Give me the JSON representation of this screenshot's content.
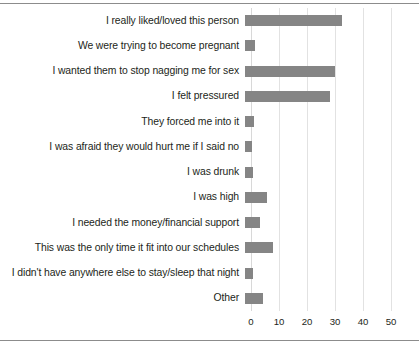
{
  "chart_data": {
    "type": "bar",
    "orientation": "horizontal",
    "title": "",
    "subtitle": "",
    "xlabel": "",
    "ylabel": "",
    "xlim": [
      0,
      50
    ],
    "xticks": [
      "0",
      "10",
      "20",
      "30",
      "40",
      "50"
    ],
    "xtick_values": [
      0,
      10,
      20,
      30,
      40,
      50
    ],
    "grid": true,
    "legend": false,
    "bar_color": "#858585",
    "gridline_color": "#e2e2e2",
    "categories": [
      "I really liked/loved this person",
      "We were trying to become pregnant",
      "I wanted them to stop nagging me for sex",
      "I felt pressured",
      "They forced me into it",
      "I was afraid they would hurt me if I said no",
      "I was drunk",
      "I was high",
      "I needed the money/financial support",
      "This was the only time it fit into our schedules",
      "I didn't have anywhere else to stay/sleep that night",
      "Other"
    ],
    "values": [
      34.5,
      3.6,
      32,
      30.5,
      3.2,
      2.6,
      3,
      8,
      5.5,
      10,
      3,
      6.5
    ]
  }
}
